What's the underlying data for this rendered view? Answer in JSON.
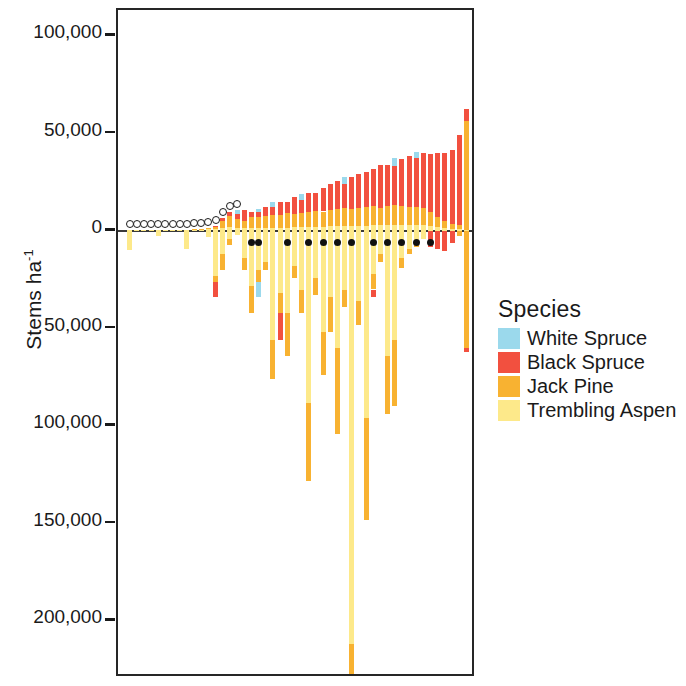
{
  "chart_data": {
    "type": "bar",
    "title": "",
    "xlabel": "",
    "ylabel": "Stems ha-1",
    "ylabel_base": "Stems ha",
    "ylabel_exponent": "-1",
    "orientation": "vertical",
    "stacked": true,
    "grid": false,
    "ylim": [
      -215000,
      112000
    ],
    "y_axis_note": "Tick labels below zero are shown as positive magnitudes (no minus sign)",
    "yticks": [
      100000,
      50000,
      0,
      -50000,
      -100000,
      -150000,
      -200000
    ],
    "ytick_labels": [
      "100,000",
      "50,000",
      "0",
      "50,000",
      "100,000",
      "150,000",
      "200,000"
    ],
    "legend": {
      "title": "Species",
      "position": "right",
      "entries": [
        {
          "name": "White Spruce",
          "color": "#9BD9EC"
        },
        {
          "name": "Black Spruce",
          "color": "#F2503F"
        },
        {
          "name": "Jack Pine",
          "color": "#F8B231"
        },
        {
          "name": "Trembling Aspen",
          "color": "#FDE98A"
        }
      ]
    },
    "series": [
      {
        "name": "White Spruce",
        "color": "#9BD9EC"
      },
      {
        "name": "Black Spruce",
        "color": "#F2503F"
      },
      {
        "name": "Jack Pine",
        "color": "#F8B231"
      },
      {
        "name": "Trembling Aspen",
        "color": "#FDE98A"
      }
    ],
    "categories": [
      "1",
      "2",
      "3",
      "4",
      "5",
      "6",
      "7",
      "8",
      "9",
      "10",
      "11",
      "12",
      "13",
      "14",
      "15",
      "16",
      "17",
      "18",
      "19",
      "20",
      "21",
      "22",
      "23",
      "24",
      "25",
      "26",
      "27",
      "28",
      "29",
      "30",
      "31",
      "32",
      "33",
      "34",
      "35",
      "36",
      "37",
      "38",
      "39",
      "40",
      "41",
      "42",
      "43",
      "44",
      "45",
      "46",
      "47",
      "48"
    ],
    "bars": [
      {
        "i": 1,
        "pos": {
          "ws": 0,
          "bs": 0,
          "jp": 0,
          "ta": 300
        },
        "neg": {
          "ta": -9500,
          "jp": 0,
          "bs": 0,
          "ws": 0
        },
        "marker": "open"
      },
      {
        "i": 2,
        "pos": {
          "ws": 0,
          "bs": 0,
          "jp": 0,
          "ta": 300
        },
        "neg": {
          "ta": 0,
          "jp": 0,
          "bs": 0,
          "ws": 0
        },
        "marker": "open"
      },
      {
        "i": 3,
        "pos": {
          "ws": 0,
          "bs": 0,
          "jp": 0,
          "ta": 300
        },
        "neg": {
          "ta": 0,
          "jp": 0,
          "bs": 0,
          "ws": 0
        },
        "marker": "open"
      },
      {
        "i": 4,
        "pos": {
          "ws": 0,
          "bs": 0,
          "jp": 0,
          "ta": 400
        },
        "neg": {
          "ta": 0,
          "jp": 0,
          "bs": 0,
          "ws": 0
        },
        "marker": "open"
      },
      {
        "i": 5,
        "pos": {
          "ws": 0,
          "bs": 0,
          "jp": 0,
          "ta": 400
        },
        "neg": {
          "ta": -2500,
          "jp": 0,
          "bs": 0,
          "ws": 0
        },
        "marker": "open"
      },
      {
        "i": 6,
        "pos": {
          "ws": 0,
          "bs": 0,
          "jp": 0,
          "ta": 400
        },
        "neg": {
          "ta": 0,
          "jp": 0,
          "bs": 0,
          "ws": 0
        },
        "marker": "open"
      },
      {
        "i": 7,
        "pos": {
          "ws": 0,
          "bs": 0,
          "jp": 0,
          "ta": 500
        },
        "neg": {
          "ta": 0,
          "jp": 0,
          "bs": 0,
          "ws": 0
        },
        "marker": "open"
      },
      {
        "i": 8,
        "pos": {
          "ws": 0,
          "bs": 0,
          "jp": 0,
          "ta": 500
        },
        "neg": {
          "ta": 0,
          "jp": 0,
          "bs": 0,
          "ws": 0
        },
        "marker": "open"
      },
      {
        "i": 9,
        "pos": {
          "ws": 0,
          "bs": 0,
          "jp": 0,
          "ta": 600
        },
        "neg": {
          "ta": -9000,
          "jp": 0,
          "bs": 0,
          "ws": 0
        },
        "marker": "open"
      },
      {
        "i": 10,
        "pos": {
          "ws": 0,
          "bs": 0,
          "jp": 200,
          "ta": 700
        },
        "neg": {
          "ta": 0,
          "jp": 0,
          "bs": 0,
          "ws": 0
        },
        "marker": "open"
      },
      {
        "i": 11,
        "pos": {
          "ws": 0,
          "bs": 0,
          "jp": 300,
          "ta": 800
        },
        "neg": {
          "ta": 0,
          "jp": 0,
          "bs": 0,
          "ws": 0
        },
        "marker": "open"
      },
      {
        "i": 12,
        "pos": {
          "ws": 0,
          "bs": 0,
          "jp": 400,
          "ta": 900
        },
        "neg": {
          "ta": -3000,
          "jp": 0,
          "bs": 0,
          "ws": 0
        },
        "marker": "open"
      },
      {
        "i": 13,
        "pos": {
          "ws": 0,
          "bs": 600,
          "jp": 1200,
          "ta": 1000
        },
        "neg": {
          "ta": -23000,
          "jp": -3000,
          "bs": -8000,
          "ws": 0
        },
        "marker": "open"
      },
      {
        "i": 14,
        "pos": {
          "ws": 0,
          "bs": 1500,
          "jp": 3500,
          "ta": 1500
        },
        "neg": {
          "ta": -12000,
          "jp": -8000,
          "bs": 0,
          "ws": 0
        },
        "marker": "open"
      },
      {
        "i": 15,
        "pos": {
          "ws": 0,
          "bs": 2000,
          "jp": 5500,
          "ta": 2000
        },
        "neg": {
          "ta": -4000,
          "jp": -3000,
          "bs": 0,
          "ws": 0
        },
        "marker": "open"
      },
      {
        "i": 16,
        "pos": {
          "ws": 2500,
          "bs": 2500,
          "jp": 4500,
          "ta": 1500
        },
        "neg": {
          "ta": -2000,
          "jp": 0,
          "bs": 0,
          "ws": 0
        },
        "marker": "open"
      },
      {
        "i": 17,
        "pos": {
          "ws": 0,
          "bs": 6000,
          "jp": 3500,
          "ta": 1500
        },
        "neg": {
          "ta": -14000,
          "jp": -6000,
          "bs": 0,
          "ws": 0
        },
        "marker": "none"
      },
      {
        "i": 18,
        "pos": {
          "ws": 0,
          "bs": 3000,
          "jp": 5500,
          "ta": 1500
        },
        "neg": {
          "ta": -28000,
          "jp": -14000,
          "bs": 0,
          "ws": 0
        },
        "marker": "filled"
      },
      {
        "i": 19,
        "pos": {
          "ws": 2000,
          "bs": 2500,
          "jp": 5500,
          "ta": 1500
        },
        "neg": {
          "ta": -20000,
          "jp": -6000,
          "bs": 0,
          "ws": -8000
        },
        "marker": "filled"
      },
      {
        "i": 20,
        "pos": {
          "ws": 0,
          "bs": 5000,
          "jp": 6000,
          "ta": 1500
        },
        "neg": {
          "ta": -16000,
          "jp": -4000,
          "bs": 0,
          "ws": 0
        },
        "marker": "none"
      },
      {
        "i": 21,
        "pos": {
          "ws": 2500,
          "bs": 4500,
          "jp": 6500,
          "ta": 1500
        },
        "neg": {
          "ta": -56000,
          "jp": -20000,
          "bs": 0,
          "ws": 0
        },
        "marker": "none"
      },
      {
        "i": 22,
        "pos": {
          "ws": 0,
          "bs": 7000,
          "jp": 6500,
          "ta": 1500
        },
        "neg": {
          "ta": -32000,
          "jp": -10000,
          "bs": -14000,
          "ws": 0
        },
        "marker": "none"
      },
      {
        "i": 23,
        "pos": {
          "ws": 0,
          "bs": 6000,
          "jp": 7500,
          "ta": 1500
        },
        "neg": {
          "ta": -42000,
          "jp": -22000,
          "bs": 0,
          "ws": 0
        },
        "marker": "filled"
      },
      {
        "i": 24,
        "pos": {
          "ws": 0,
          "bs": 9000,
          "jp": 6500,
          "ta": 2000
        },
        "neg": {
          "ta": -18000,
          "jp": -6000,
          "bs": 0,
          "ws": 0
        },
        "marker": "none"
      },
      {
        "i": 25,
        "pos": {
          "ws": 3000,
          "bs": 7000,
          "jp": 7000,
          "ta": 2000
        },
        "neg": {
          "ta": -30000,
          "jp": -12000,
          "bs": 0,
          "ws": 0
        },
        "marker": "none"
      },
      {
        "i": 26,
        "pos": {
          "ws": 0,
          "bs": 10000,
          "jp": 7500,
          "ta": 2000
        },
        "neg": {
          "ta": -88000,
          "jp": -40000,
          "bs": 0,
          "ws": 0
        },
        "marker": "filled"
      },
      {
        "i": 27,
        "pos": {
          "ws": 0,
          "bs": 9000,
          "jp": 8500,
          "ta": 2000
        },
        "neg": {
          "ta": -24000,
          "jp": -9000,
          "bs": 0,
          "ws": 0
        },
        "marker": "none"
      },
      {
        "i": 28,
        "pos": {
          "ws": 0,
          "bs": 12000,
          "jp": 8000,
          "ta": 2000
        },
        "neg": {
          "ta": -52000,
          "jp": -22000,
          "bs": 0,
          "ws": 0
        },
        "marker": "filled"
      },
      {
        "i": 29,
        "pos": {
          "ws": 0,
          "bs": 13000,
          "jp": 8500,
          "ta": 2500
        },
        "neg": {
          "ta": -34000,
          "jp": -18000,
          "bs": 0,
          "ws": 0
        },
        "marker": "none"
      },
      {
        "i": 30,
        "pos": {
          "ws": 0,
          "bs": 14000,
          "jp": 9000,
          "ta": 2500
        },
        "neg": {
          "ta": -60000,
          "jp": -44000,
          "bs": 0,
          "ws": 0
        },
        "marker": "filled"
      },
      {
        "i": 31,
        "pos": {
          "ws": 3500,
          "bs": 12000,
          "jp": 9500,
          "ta": 2500
        },
        "neg": {
          "ta": -30000,
          "jp": -9000,
          "bs": 0,
          "ws": 0
        },
        "marker": "none"
      },
      {
        "i": 32,
        "pos": {
          "ws": 0,
          "bs": 16000,
          "jp": 9000,
          "ta": 2500
        },
        "neg": {
          "ta": -212000,
          "jp": -20000,
          "bs": -10000,
          "ws": 0
        },
        "marker": "filled"
      },
      {
        "i": 33,
        "pos": {
          "ws": 0,
          "bs": 17000,
          "jp": 9500,
          "ta": 2500
        },
        "neg": {
          "ta": -36000,
          "jp": -12000,
          "bs": 0,
          "ws": 0
        },
        "marker": "none"
      },
      {
        "i": 34,
        "pos": {
          "ws": 0,
          "bs": 18000,
          "jp": 10000,
          "ta": 2500
        },
        "neg": {
          "ta": -96000,
          "jp": -52000,
          "bs": 0,
          "ws": 0
        },
        "marker": "none"
      },
      {
        "i": 35,
        "pos": {
          "ws": 0,
          "bs": 19000,
          "jp": 10000,
          "ta": 3000
        },
        "neg": {
          "ta": -22000,
          "jp": -8000,
          "bs": -4000,
          "ws": 0
        },
        "marker": "filled"
      },
      {
        "i": 36,
        "pos": {
          "ws": 0,
          "bs": 22000,
          "jp": 9000,
          "ta": 3000
        },
        "neg": {
          "ta": -12000,
          "jp": -4000,
          "bs": 0,
          "ws": 0
        },
        "marker": "none"
      },
      {
        "i": 37,
        "pos": {
          "ws": 0,
          "bs": 21000,
          "jp": 10000,
          "ta": 3000
        },
        "neg": {
          "ta": -64000,
          "jp": -30000,
          "bs": 0,
          "ws": 0
        },
        "marker": "filled"
      },
      {
        "i": 38,
        "pos": {
          "ws": 4000,
          "bs": 20000,
          "jp": 10500,
          "ta": 3000
        },
        "neg": {
          "ta": -56000,
          "jp": -34000,
          "bs": 0,
          "ws": 0
        },
        "marker": "none"
      },
      {
        "i": 39,
        "pos": {
          "ws": 0,
          "bs": 24000,
          "jp": 10000,
          "ta": 3000
        },
        "neg": {
          "ta": -14000,
          "jp": -5000,
          "bs": 0,
          "ws": 0
        },
        "marker": "filled"
      },
      {
        "i": 40,
        "pos": {
          "ws": 0,
          "bs": 26000,
          "jp": 9500,
          "ta": 3000
        },
        "neg": {
          "ta": -9000,
          "jp": -3000,
          "bs": 0,
          "ws": 0
        },
        "marker": "none"
      },
      {
        "i": 41,
        "pos": {
          "ws": 3000,
          "bs": 25000,
          "jp": 9500,
          "ta": 3000
        },
        "neg": {
          "ta": -6000,
          "jp": -2000,
          "bs": 0,
          "ws": 0
        },
        "marker": "filled"
      },
      {
        "i": 42,
        "pos": {
          "ws": 0,
          "bs": 28000,
          "jp": 9000,
          "ta": 3000
        },
        "neg": {
          "ta": -4000,
          "jp": 0,
          "bs": 0,
          "ws": 0
        },
        "marker": "none"
      },
      {
        "i": 43,
        "pos": {
          "ws": 0,
          "bs": 30000,
          "jp": 7000,
          "ta": 2500
        },
        "neg": {
          "ta": 0,
          "jp": 0,
          "bs": -8000,
          "ws": 0
        },
        "marker": "filled"
      },
      {
        "i": 44,
        "pos": {
          "ws": 0,
          "bs": 33000,
          "jp": 5000,
          "ta": 2000
        },
        "neg": {
          "ta": 0,
          "jp": 0,
          "bs": -9000,
          "ws": 0
        },
        "marker": "none"
      },
      {
        "i": 45,
        "pos": {
          "ws": 0,
          "bs": 35000,
          "jp": 3500,
          "ta": 1500
        },
        "neg": {
          "ta": 0,
          "jp": 0,
          "bs": -10000,
          "ws": 0
        },
        "marker": "none"
      },
      {
        "i": 46,
        "pos": {
          "ws": 0,
          "bs": 38000,
          "jp": 2500,
          "ta": 1000
        },
        "neg": {
          "ta": 0,
          "jp": 0,
          "bs": -6000,
          "ws": 0
        },
        "marker": "none"
      },
      {
        "i": 47,
        "pos": {
          "ws": 0,
          "bs": 46000,
          "jp": 2000,
          "ta": 1000
        },
        "neg": {
          "ta": 0,
          "jp": -2500,
          "bs": 0,
          "ws": 0
        },
        "marker": "none"
      },
      {
        "i": 48,
        "pos": {
          "ws": 0,
          "bs": 6000,
          "jp": 56000,
          "ta": 500
        },
        "neg": {
          "ta": 0,
          "jp": -60000,
          "bs": -2000,
          "ws": 0
        },
        "marker": "none"
      }
    ],
    "markers": {
      "open": {
        "label": "open circle",
        "fill": "#ffffff",
        "stroke": "#1a1a1a"
      },
      "filled": {
        "label": "filled circle",
        "fill": "#111111"
      }
    }
  }
}
